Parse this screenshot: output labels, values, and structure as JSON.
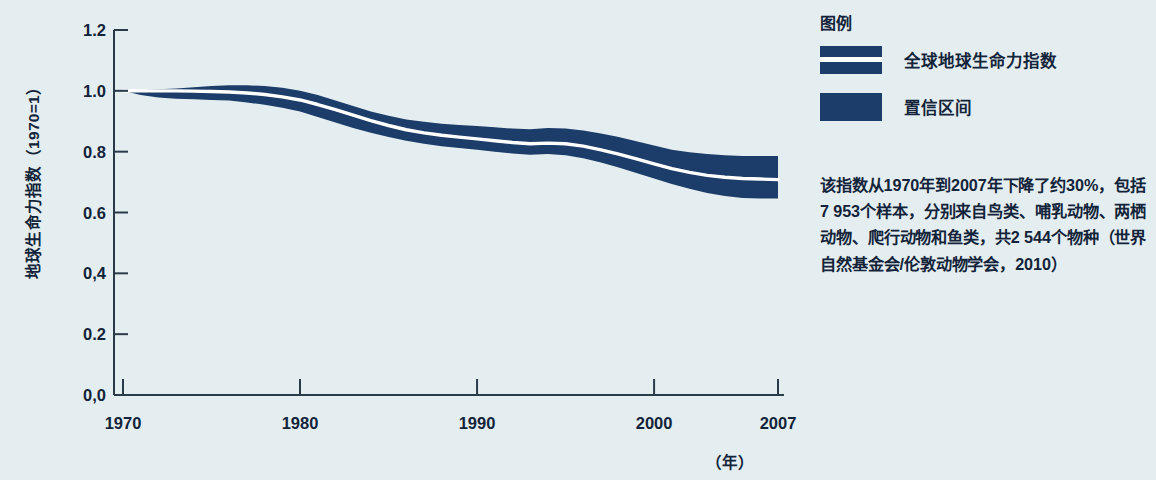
{
  "colors": {
    "navy": "#1c3c69",
    "background": "#e4eef0",
    "axis": "#2b3a49",
    "line": "#ffffff"
  },
  "axes": {
    "y_title": "地球生命力指数（1970=1）",
    "y_ticks": [
      "1.2",
      "1.0",
      "0.8",
      "0.6",
      "0,4",
      "0.2",
      "0,0"
    ],
    "x_ticks": [
      "1970",
      "1980",
      "1990",
      "2000",
      "2007"
    ],
    "x_unit": "（年）"
  },
  "legend": {
    "title": "图例",
    "items": [
      {
        "label": "全球地球生命力指数",
        "swatch": "line-in-band"
      },
      {
        "label": "置信区间",
        "swatch": "solid-band"
      }
    ]
  },
  "description": "该指数从1970年到2007年下降了约30%，包括7 953个样本，分别来自鸟类、哺乳动物、两栖动物、爬行动物和鱼类，共2 544个物种（世界自然基金会/伦敦动物学会，2010）",
  "chart_data": {
    "type": "area",
    "title": "",
    "xlabel": "（年）",
    "ylabel": "地球生命力指数（1970=1）",
    "xlim": [
      1970,
      2007
    ],
    "ylim": [
      0.0,
      1.2
    ],
    "yticks": [
      0.0,
      0.2,
      0.4,
      0.6,
      0.8,
      1.0,
      1.2
    ],
    "xticks": [
      1970,
      1980,
      1990,
      2000,
      2007
    ],
    "grid": false,
    "legend_position": "right",
    "x": [
      1970,
      1971,
      1972,
      1973,
      1974,
      1975,
      1976,
      1977,
      1978,
      1979,
      1980,
      1981,
      1982,
      1983,
      1984,
      1985,
      1986,
      1987,
      1988,
      1989,
      1990,
      1991,
      1992,
      1993,
      1994,
      1995,
      1996,
      1997,
      1998,
      1999,
      2000,
      2001,
      2002,
      2003,
      2004,
      2005,
      2006,
      2007
    ],
    "series": [
      {
        "name": "全球地球生命力指数",
        "values": [
          1.0,
          1.0,
          1.0,
          1.0,
          0.999,
          0.998,
          0.996,
          0.993,
          0.988,
          0.98,
          0.97,
          0.955,
          0.938,
          0.92,
          0.902,
          0.886,
          0.872,
          0.862,
          0.854,
          0.848,
          0.842,
          0.836,
          0.83,
          0.826,
          0.828,
          0.826,
          0.818,
          0.806,
          0.792,
          0.776,
          0.76,
          0.744,
          0.732,
          0.722,
          0.716,
          0.712,
          0.71,
          0.708
        ]
      },
      {
        "name": "置信区间上限",
        "values": [
          1.0,
          1.002,
          1.005,
          1.008,
          1.012,
          1.016,
          1.018,
          1.018,
          1.016,
          1.01,
          1.0,
          0.986,
          0.968,
          0.95,
          0.932,
          0.918,
          0.906,
          0.898,
          0.892,
          0.888,
          0.884,
          0.88,
          0.876,
          0.874,
          0.878,
          0.876,
          0.87,
          0.86,
          0.848,
          0.834,
          0.82,
          0.806,
          0.798,
          0.792,
          0.788,
          0.786,
          0.786,
          0.786
        ]
      },
      {
        "name": "置信区间下限",
        "values": [
          1.0,
          0.986,
          0.978,
          0.974,
          0.972,
          0.97,
          0.968,
          0.962,
          0.954,
          0.944,
          0.932,
          0.914,
          0.896,
          0.878,
          0.862,
          0.848,
          0.836,
          0.826,
          0.818,
          0.812,
          0.806,
          0.8,
          0.794,
          0.79,
          0.792,
          0.788,
          0.778,
          0.764,
          0.748,
          0.73,
          0.712,
          0.694,
          0.678,
          0.664,
          0.654,
          0.648,
          0.646,
          0.646
        ]
      }
    ]
  }
}
